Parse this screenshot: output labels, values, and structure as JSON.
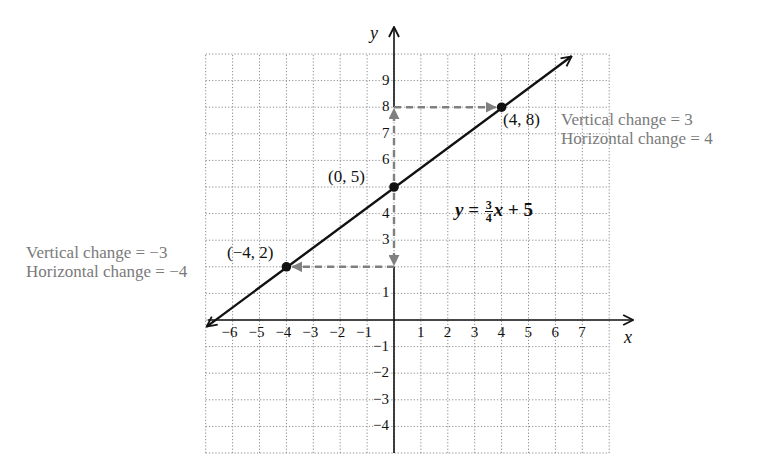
{
  "chart_data": {
    "type": "line",
    "title": "",
    "xlabel": "x",
    "ylabel": "y",
    "xlim": [
      -7,
      8
    ],
    "ylim": [
      -5,
      10
    ],
    "grid": true,
    "grid_style": "dotted",
    "x_ticks": [
      -6,
      -5,
      -4,
      -3,
      -2,
      -1,
      1,
      2,
      3,
      4,
      5,
      6,
      7
    ],
    "y_ticks": [
      -4,
      -3,
      -2,
      -1,
      1,
      3,
      4,
      6,
      7,
      8,
      9
    ],
    "x_tick_labels": [
      "−6",
      "−5",
      "−4",
      "−3",
      "−2",
      "−1",
      "1",
      "2",
      "3",
      "4",
      "5",
      "6",
      "7"
    ],
    "y_tick_labels": [
      "−4",
      "−3",
      "−2",
      "−1",
      "1",
      "3",
      "4",
      "6",
      "7",
      "8",
      "9"
    ],
    "series": [
      {
        "name": "y = 3/4 x + 5",
        "slope": 0.75,
        "intercept": 5,
        "x": [
          -7,
          7
        ],
        "y": [
          -0.25,
          10.25
        ],
        "color": "#111111"
      }
    ],
    "points": [
      {
        "x": -4,
        "y": 2,
        "label": "(−4, 2)"
      },
      {
        "x": 0,
        "y": 5,
        "label": "(0, 5)"
      },
      {
        "x": 4,
        "y": 8,
        "label": "(4, 8)"
      }
    ],
    "annotations": [
      {
        "text": "Vertical change = 3",
        "color": "#7a7a7a"
      },
      {
        "text": "Horizontal change = 4",
        "color": "#7a7a7a"
      },
      {
        "text": "Vertical change = −3",
        "color": "#7a7a7a"
      },
      {
        "text": "Horizontal change = −4",
        "color": "#7a7a7a"
      }
    ],
    "equation": "y = 3/4 x + 5",
    "dashed_paths": [
      {
        "from": [
          0,
          5
        ],
        "to": [
          0,
          8
        ],
        "then": [
          4,
          8
        ],
        "color": "#808080"
      },
      {
        "from": [
          0,
          5
        ],
        "to": [
          0,
          2
        ],
        "then": [
          -4,
          2
        ],
        "color": "#808080"
      }
    ]
  },
  "labels": {
    "x_axis": "x",
    "y_axis": "y",
    "point_a": "(4, 8)",
    "point_b": "(0, 5)",
    "point_c": "(−4, 2)",
    "upper_vertical": "Vertical change = 3",
    "upper_horizontal": "Horizontal change = 4",
    "lower_vertical": "Vertical change = −3",
    "lower_horizontal": "Horizontal change = −4",
    "eq_y": "y",
    "eq_equals": " = ",
    "eq_num": "3",
    "eq_den": "4",
    "eq_x": "x",
    "eq_rest": " + 5"
  },
  "colors": {
    "line": "#111111",
    "axis": "#111111",
    "grid": "#8a8a8a",
    "dashed": "#808080",
    "annotation": "#7a7a7a"
  }
}
